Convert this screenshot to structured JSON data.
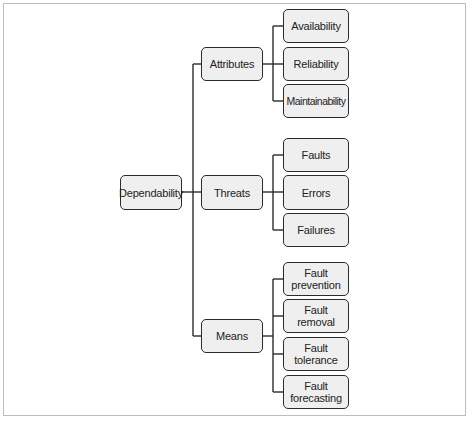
{
  "diagram": {
    "type": "tree",
    "root": {
      "label": "Dependability"
    },
    "branches": [
      {
        "label": "Attributes",
        "children": [
          "Availability",
          "Reliability",
          "Maintainability"
        ]
      },
      {
        "label": "Threats",
        "children": [
          "Faults",
          "Errors",
          "Failures"
        ]
      },
      {
        "label": "Means",
        "children": [
          "Fault\nprevention",
          "Fault\nremoval",
          "Fault\ntolerance",
          "Fault\nforecasting"
        ]
      }
    ]
  },
  "labels": {
    "root": "Dependability",
    "attributes": "Attributes",
    "threats": "Threats",
    "means": "Means",
    "availability": "Availability",
    "reliability": "Reliability",
    "maintainability": "Maintainability",
    "faults": "Faults",
    "errors": "Errors",
    "failures": "Failures",
    "fault_prevention_1": "Fault",
    "fault_prevention_2": "prevention",
    "fault_removal_1": "Fault",
    "fault_removal_2": "removal",
    "fault_tolerance_1": "Fault",
    "fault_tolerance_2": "tolerance",
    "fault_forecasting_1": "Fault",
    "fault_forecasting_2": "forecasting"
  },
  "colors": {
    "node_fill": "#efefef",
    "node_border": "#2b2b2b",
    "frame_border": "#bdbdbd"
  }
}
